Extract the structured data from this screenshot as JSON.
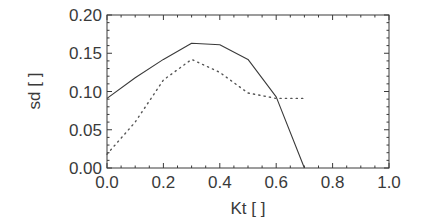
{
  "chart_data": {
    "type": "line",
    "title": "",
    "xlabel": "Kt [ ]",
    "ylabel": "sd [ ]",
    "xlim": [
      0.0,
      1.0
    ],
    "ylim": [
      0.0,
      0.2
    ],
    "x_ticks": [
      "0.0",
      "0.2",
      "0.4",
      "0.6",
      "0.8",
      "1.0"
    ],
    "y_ticks": [
      "0.00",
      "0.05",
      "0.10",
      "0.15",
      "0.20"
    ],
    "grid": false,
    "legend": null,
    "x": [
      0.0,
      0.1,
      0.2,
      0.3,
      0.4,
      0.5,
      0.6,
      0.7
    ],
    "series": [
      {
        "name": "solid",
        "style": "solid",
        "values": [
          0.091,
          0.118,
          0.142,
          0.163,
          0.161,
          0.142,
          0.093,
          0.0
        ]
      },
      {
        "name": "dotted",
        "style": "dotted",
        "values": [
          0.018,
          0.06,
          0.115,
          0.142,
          0.125,
          0.098,
          0.091,
          0.091
        ]
      }
    ],
    "colors": {
      "axis": "#3a3a3a",
      "line": "#3a3a3a"
    }
  }
}
